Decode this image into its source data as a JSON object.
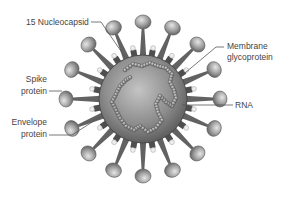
{
  "diagram": {
    "labels": {
      "nucleocapsid": "15 Nucleocapsid",
      "spike_line1": "Spike",
      "spike_line2": "protein",
      "envelope_line1": "Envelope",
      "envelope_line2": "protein",
      "membrane_line1": "Membrane",
      "membrane_line2": "glycoprotein",
      "rna": "RNA"
    },
    "colors": {
      "background": "#ffffff",
      "body_light": "#b8b8b8",
      "body_dark": "#5a5a5a",
      "spike_stalk": "#606060",
      "spike_head_light": "#d8d8d8",
      "spike_head_dark": "#6e6e6e",
      "rna_bead": "#8a8a8a",
      "label_text": "#444444",
      "leader_line": "#555555"
    }
  }
}
